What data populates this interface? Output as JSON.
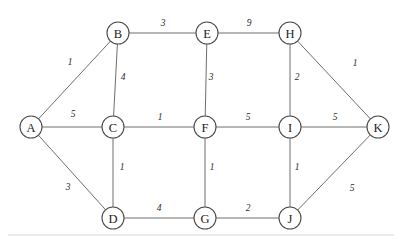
{
  "figure": {
    "width": 402,
    "height": 239,
    "background_color": "#ffffff",
    "edge_color": "#6e6e6e",
    "node_stroke_color": "#4a4a4a",
    "node_fill_color": "#ffffff",
    "label_color": "#1c1c1c",
    "baseline_rule_color": "#d8d8d8"
  },
  "chart_data": {
    "type": "diagram",
    "diagram_kind": "weighted-undirected-graph",
    "title": "",
    "xlabel": "",
    "ylabel": "",
    "grid": false,
    "legend": null,
    "node_radius": 11,
    "nodes": [
      {
        "id": "A",
        "label": "A",
        "x": 31,
        "y": 127
      },
      {
        "id": "B",
        "label": "B",
        "x": 118,
        "y": 33
      },
      {
        "id": "C",
        "label": "C",
        "x": 113,
        "y": 127
      },
      {
        "id": "D",
        "label": "D",
        "x": 113,
        "y": 218
      },
      {
        "id": "E",
        "label": "E",
        "x": 207,
        "y": 33
      },
      {
        "id": "F",
        "label": "F",
        "x": 205,
        "y": 127
      },
      {
        "id": "G",
        "label": "G",
        "x": 205,
        "y": 218
      },
      {
        "id": "H",
        "label": "H",
        "x": 290,
        "y": 33
      },
      {
        "id": "I",
        "label": "I",
        "x": 290,
        "y": 127
      },
      {
        "id": "J",
        "label": "J",
        "x": 290,
        "y": 218
      },
      {
        "id": "K",
        "label": "K",
        "x": 378,
        "y": 127
      }
    ],
    "edges": [
      {
        "from": "A",
        "to": "B",
        "weight": "1",
        "label_x": 70,
        "label_y": 62
      },
      {
        "from": "A",
        "to": "C",
        "weight": "5",
        "label_x": 73,
        "label_y": 114
      },
      {
        "from": "A",
        "to": "D",
        "weight": "3",
        "label_x": 68,
        "label_y": 187
      },
      {
        "from": "B",
        "to": "E",
        "weight": "3",
        "label_x": 163,
        "label_y": 23
      },
      {
        "from": "B",
        "to": "C",
        "weight": "4",
        "label_x": 123,
        "label_y": 77
      },
      {
        "from": "C",
        "to": "F",
        "weight": "1",
        "label_x": 160,
        "label_y": 117
      },
      {
        "from": "C",
        "to": "D",
        "weight": "1",
        "label_x": 122,
        "label_y": 167
      },
      {
        "from": "D",
        "to": "G",
        "weight": "4",
        "label_x": 159,
        "label_y": 208
      },
      {
        "from": "E",
        "to": "H",
        "weight": "9",
        "label_x": 249,
        "label_y": 23
      },
      {
        "from": "E",
        "to": "F",
        "weight": "3",
        "label_x": 211,
        "label_y": 77
      },
      {
        "from": "F",
        "to": "I",
        "weight": "5",
        "label_x": 248,
        "label_y": 117
      },
      {
        "from": "F",
        "to": "G",
        "weight": "1",
        "label_x": 212,
        "label_y": 167
      },
      {
        "from": "G",
        "to": "J",
        "weight": "2",
        "label_x": 248,
        "label_y": 208
      },
      {
        "from": "H",
        "to": "I",
        "weight": "2",
        "label_x": 297,
        "label_y": 77
      },
      {
        "from": "H",
        "to": "K",
        "weight": "1",
        "label_x": 355,
        "label_y": 63
      },
      {
        "from": "I",
        "to": "J",
        "weight": "1",
        "label_x": 297,
        "label_y": 167
      },
      {
        "from": "I",
        "to": "K",
        "weight": "5",
        "label_x": 335,
        "label_y": 117
      },
      {
        "from": "J",
        "to": "K",
        "weight": "5",
        "label_x": 352,
        "label_y": 188
      }
    ],
    "baseline_rule": {
      "x1": 8,
      "y1": 235,
      "x2": 394,
      "y2": 235
    }
  }
}
